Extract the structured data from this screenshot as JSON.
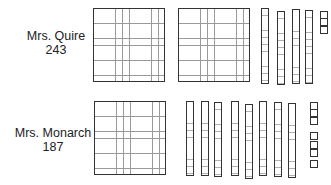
{
  "rows": [
    {
      "name": "Mrs. Quire",
      "number": "243",
      "hundreds": 2,
      "tens": 4,
      "ones": 3
    },
    {
      "name": "Mrs. Monarch",
      "number": "187",
      "hundreds": 1,
      "tens": 8,
      "ones": 7
    }
  ]
}
